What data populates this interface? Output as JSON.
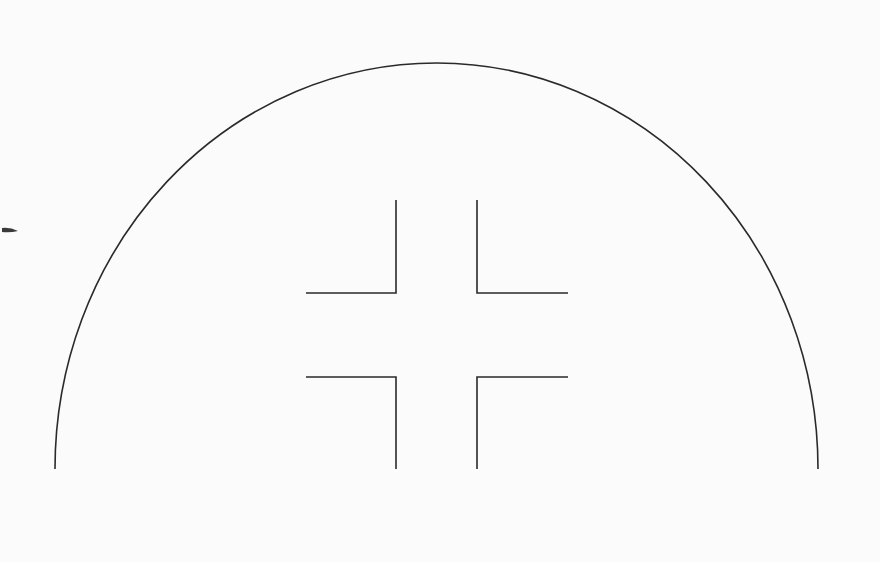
{
  "diagram": {
    "background": "#fbfbfb",
    "stroke_color": "#2a2a2a",
    "arc": {
      "left_end": [
        55,
        469
      ],
      "right_end": [
        818,
        469
      ],
      "apex": [
        436.5,
        63
      ],
      "radius_x": 381.5,
      "radius_y": 406
    },
    "brackets": [
      {
        "id": "top-left",
        "points": [
          [
            396,
            200
          ],
          [
            396,
            293
          ],
          [
            306,
            293
          ]
        ]
      },
      {
        "id": "top-right",
        "points": [
          [
            477,
            200
          ],
          [
            477,
            293
          ],
          [
            568,
            293
          ]
        ]
      },
      {
        "id": "bottom-left",
        "points": [
          [
            306,
            377
          ],
          [
            396,
            377
          ],
          [
            396,
            469
          ]
        ]
      },
      {
        "id": "bottom-right",
        "points": [
          [
            568,
            377
          ],
          [
            477,
            377
          ],
          [
            477,
            469
          ]
        ]
      }
    ],
    "artifact_mark": {
      "x": 8,
      "y": 230
    }
  }
}
